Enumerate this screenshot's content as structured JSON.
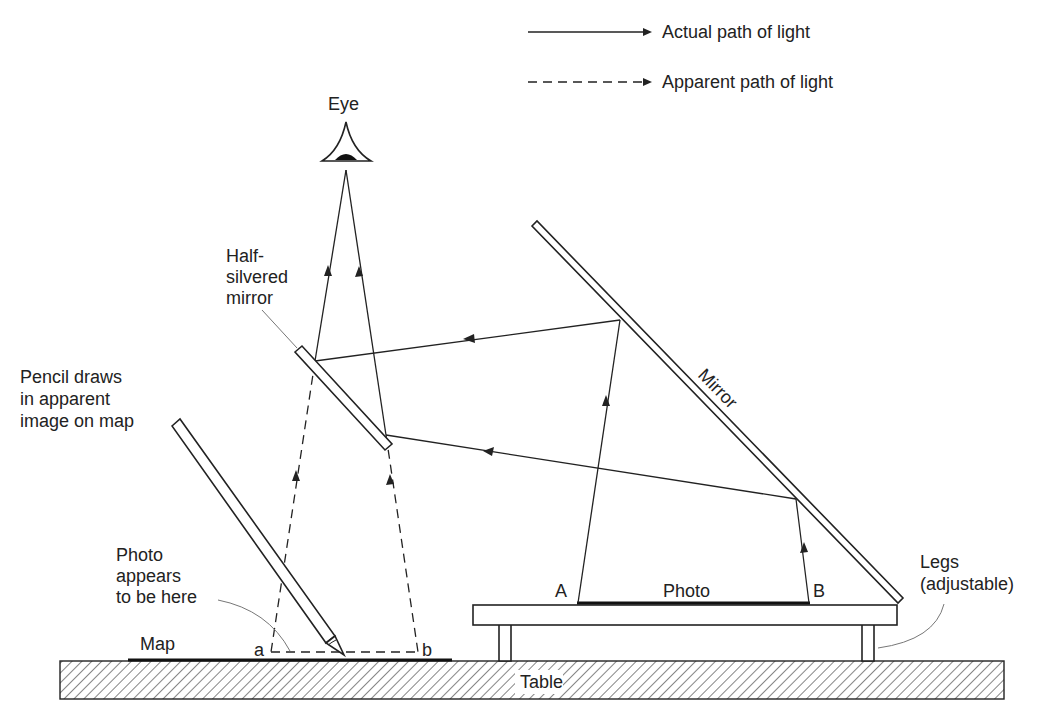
{
  "legend": {
    "actual": "Actual path of light",
    "apparent": "Apparent path of light"
  },
  "labels": {
    "eye": "Eye",
    "half_silvered_1": "Half-",
    "half_silvered_2": "silvered",
    "half_silvered_3": "mirror",
    "pencil_1": "Pencil draws",
    "pencil_2": "in apparent",
    "pencil_3": "image on map",
    "photo_appears_1": "Photo",
    "photo_appears_2": "appears",
    "photo_appears_3": "to be here",
    "map": "Map",
    "point_a_small": "a",
    "point_b_small": "b",
    "point_A": "A",
    "point_B": "B",
    "photo": "Photo",
    "mirror": "Mirror",
    "legs_1": "Legs",
    "legs_2": "(adjustable)",
    "table": "Table"
  },
  "colors": {
    "ink": "#222222",
    "background": "#ffffff"
  }
}
